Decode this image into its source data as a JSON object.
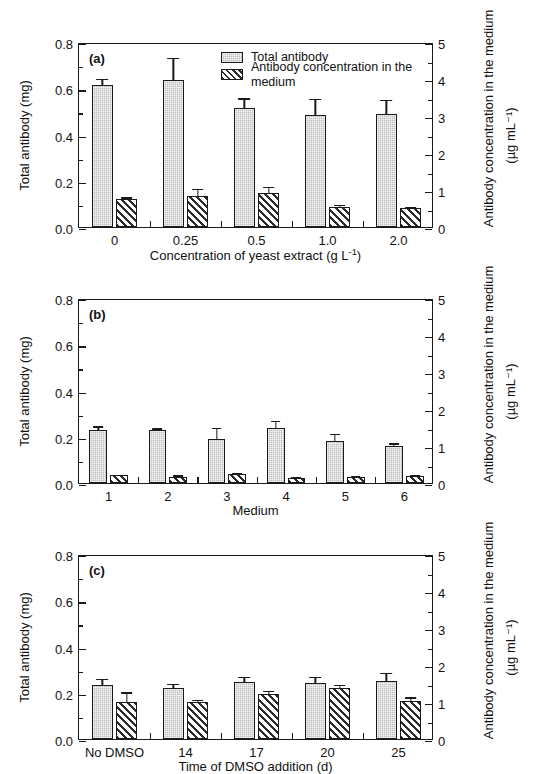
{
  "figure": {
    "panels": [
      "a",
      "b",
      "c"
    ],
    "legend": {
      "items": [
        {
          "key": "solid",
          "label": "Total antibody"
        },
        {
          "key": "hatch",
          "label": "Antibody concentration in the medium"
        }
      ]
    },
    "axis_titles": {
      "left": "Total antibody (mg)",
      "right_main": "Antibody concentration in the medium",
      "right_units": "(µg mL⁻¹)"
    }
  },
  "chart_data": [
    {
      "type": "bar",
      "panel": "a",
      "title": "(a)",
      "xlabel": "Concentration of yeast extract (g L⁻¹)",
      "ylabel": "Total antibody (mg)",
      "y2label": "Antibody concentration in the medium (µg mL⁻¹)",
      "categories": [
        "0",
        "0.25",
        "0.5",
        "1.0",
        "2.0"
      ],
      "ylim": [
        0.0,
        0.8
      ],
      "y2lim": [
        0,
        5
      ],
      "yticks": [
        "0.0",
        "0.2",
        "0.4",
        "0.6",
        "0.8"
      ],
      "y2ticks": [
        "0",
        "1",
        "2",
        "3",
        "4",
        "5"
      ],
      "grid": false,
      "legend_position": "top-right",
      "series": [
        {
          "name": "Total antibody",
          "axis": "left",
          "pattern": "solid",
          "values": [
            0.615,
            0.635,
            0.515,
            0.485,
            0.487
          ],
          "errors": [
            0.027,
            0.095,
            0.042,
            0.069,
            0.062
          ]
        },
        {
          "name": "Antibody concentration in the medium",
          "axis": "right",
          "pattern": "hatch",
          "values": [
            0.76,
            0.84,
            0.93,
            0.53,
            0.51
          ],
          "errors": [
            0.04,
            0.2,
            0.16,
            0.07,
            0.03
          ]
        }
      ]
    },
    {
      "type": "bar",
      "panel": "b",
      "title": "(b)",
      "xlabel": "Medium",
      "ylabel": "Total antibody (mg)",
      "y2label": "Antibody concentration in the medium (µg mL⁻¹)",
      "categories": [
        "1",
        "2",
        "3",
        "4",
        "5",
        "6"
      ],
      "ylim": [
        0.0,
        0.8
      ],
      "y2lim": [
        0,
        5
      ],
      "yticks": [
        "0.0",
        "0.2",
        "0.4",
        "0.6",
        "0.8"
      ],
      "y2ticks": [
        "0",
        "1",
        "2",
        "3",
        "4",
        "5"
      ],
      "grid": false,
      "legend_position": "none",
      "series": [
        {
          "name": "Total antibody",
          "axis": "left",
          "pattern": "solid",
          "values": [
            0.229,
            0.231,
            0.19,
            0.236,
            0.183,
            0.161
          ],
          "errors": [
            0.016,
            0.006,
            0.048,
            0.034,
            0.029,
            0.011
          ]
        },
        {
          "name": "Antibody concentration in the medium",
          "axis": "right",
          "pattern": "hatch",
          "values": [
            0.21,
            0.16,
            0.25,
            0.13,
            0.17,
            0.2
          ],
          "errors": [
            0.02,
            0.05,
            0.03,
            0.04,
            0.03,
            0.03
          ]
        }
      ]
    },
    {
      "type": "bar",
      "panel": "c",
      "title": "(c)",
      "xlabel": "Time of DMSO addition (d)",
      "ylabel": "Total antibody (mg)",
      "y2label": "Antibody concentration in the medium (µg mL⁻¹)",
      "categories": [
        "No DMSO",
        "14",
        "17",
        "20",
        "25"
      ],
      "ylim": [
        0.0,
        0.8
      ],
      "y2lim": [
        0,
        5
      ],
      "yticks": [
        "0.0",
        "0.2",
        "0.4",
        "0.6",
        "0.8"
      ],
      "y2ticks": [
        "0",
        "1",
        "2",
        "3",
        "4",
        "5"
      ],
      "grid": false,
      "legend_position": "none",
      "series": [
        {
          "name": "Total antibody",
          "axis": "left",
          "pattern": "solid",
          "values": [
            0.234,
            0.219,
            0.248,
            0.241,
            0.252
          ],
          "errors": [
            0.026,
            0.02,
            0.021,
            0.028,
            0.033
          ]
        },
        {
          "name": "Antibody concentration in the medium",
          "axis": "right",
          "pattern": "hatch",
          "values": [
            0.99,
            1.01,
            1.22,
            1.39,
            1.03
          ],
          "errors": [
            0.27,
            0.05,
            0.09,
            0.08,
            0.1
          ]
        }
      ]
    }
  ]
}
